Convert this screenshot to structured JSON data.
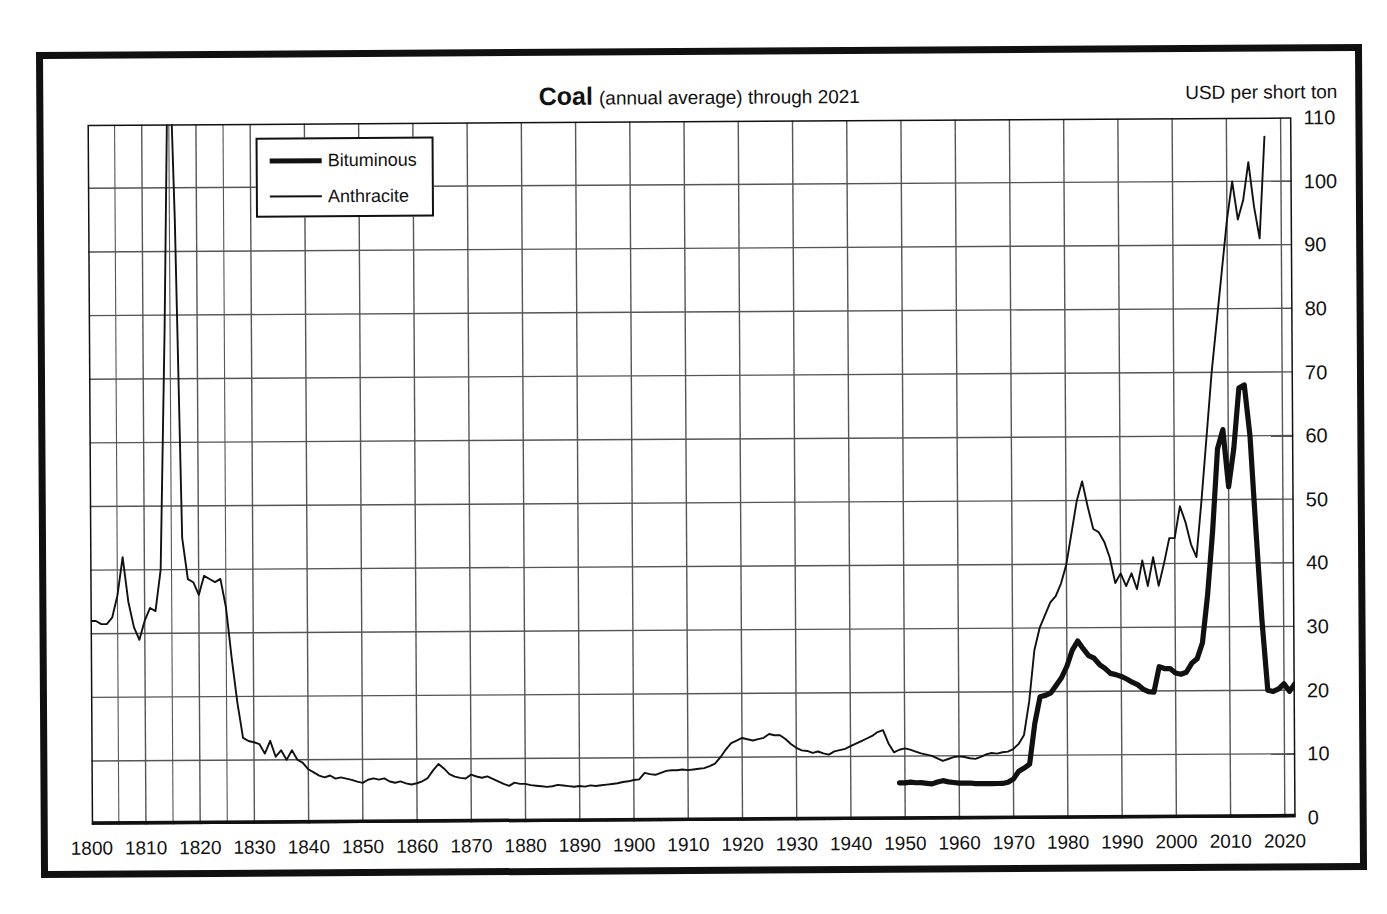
{
  "scan": {
    "top_artifact_text": ""
  },
  "header": {
    "title_main": "Coal",
    "title_sub": "(annual average) through 2021",
    "unit_label": "USD per short ton"
  },
  "legend": {
    "items": [
      {
        "label": "Bituminous",
        "style": "thick"
      },
      {
        "label": "Anthracite",
        "style": "thin"
      }
    ]
  },
  "colors": {
    "ink": "#111111",
    "grid": "#555555",
    "frame": "#101010",
    "background": "#ffffff"
  },
  "chart_data": {
    "type": "line",
    "title": "Coal (annual average) through 2021",
    "subtitle": "",
    "xlabel": "",
    "ylabel": "USD per short ton",
    "xlim": [
      1800,
      2022
    ],
    "ylim": [
      0,
      110
    ],
    "grid": true,
    "legend_position": "top-left-inside",
    "x_ticks": [
      1800,
      1810,
      1820,
      1830,
      1840,
      1850,
      1860,
      1870,
      1880,
      1890,
      1900,
      1910,
      1920,
      1930,
      1940,
      1950,
      1960,
      1970,
      1980,
      1990,
      2000,
      2010,
      2020
    ],
    "x_minor_tick_step": 5,
    "y_ticks": [
      0,
      10,
      20,
      30,
      40,
      50,
      60,
      70,
      80,
      90,
      100,
      110
    ],
    "y_tick_labels": [
      "0",
      "10",
      "20",
      "30",
      "40",
      "50",
      "60",
      "70",
      "80",
      "90",
      "100",
      "110"
    ],
    "series": [
      {
        "name": "Anthracite",
        "style": "thin",
        "x_start": 1800,
        "values": [
          32.0,
          32.0,
          31.5,
          31.5,
          32.5,
          36.0,
          42.0,
          35.0,
          31.0,
          29.0,
          32.0,
          34.0,
          33.5,
          40.0,
          78.0,
          128.0,
          95.0,
          45.0,
          38.5,
          38.0,
          36.0,
          39.0,
          38.5,
          38.0,
          38.5,
          34.0,
          26.0,
          19.0,
          13.5,
          13.0,
          12.8,
          12.5,
          11.0,
          13.0,
          10.5,
          11.5,
          10.0,
          11.5,
          10.0,
          9.5,
          8.5,
          8.0,
          7.5,
          7.2,
          7.5,
          7.0,
          7.2,
          7.0,
          6.8,
          6.5,
          6.3,
          6.8,
          7.0,
          6.8,
          7.0,
          6.5,
          6.3,
          6.5,
          6.2,
          6.0,
          6.2,
          6.5,
          7.0,
          8.2,
          9.2,
          8.5,
          7.6,
          7.2,
          7.0,
          6.9,
          7.5,
          7.2,
          7.0,
          7.2,
          6.8,
          6.4,
          6.0,
          5.7,
          6.2,
          6.0,
          6.0,
          5.8,
          5.7,
          5.6,
          5.5,
          5.6,
          5.8,
          5.7,
          5.6,
          5.5,
          5.6,
          5.5,
          5.7,
          5.6,
          5.7,
          5.8,
          5.9,
          6.0,
          6.2,
          6.3,
          6.5,
          6.6,
          7.6,
          7.4,
          7.3,
          7.6,
          7.9,
          8.0,
          8.0,
          8.1,
          8.0,
          8.1,
          8.2,
          8.3,
          8.6,
          9.0,
          10.0,
          11.2,
          12.2,
          12.6,
          13.0,
          12.8,
          12.6,
          12.8,
          13.0,
          13.6,
          13.4,
          13.4,
          12.8,
          12.0,
          11.4,
          11.0,
          10.9,
          10.6,
          10.8,
          10.5,
          10.3,
          10.8,
          11.0,
          11.2,
          11.6,
          12.0,
          12.4,
          12.8,
          13.2,
          13.8,
          14.1,
          12.0,
          10.6,
          11.0,
          11.2,
          11.0,
          10.7,
          10.4,
          10.2,
          10.0,
          9.6,
          9.2,
          9.5,
          9.8,
          9.9,
          9.8,
          9.6,
          9.5,
          9.8,
          10.2,
          10.4,
          10.3,
          10.5,
          10.6,
          11.0,
          11.8,
          13.2,
          18.5,
          26.5,
          30.0,
          32.0,
          34.0,
          35.0,
          37.0,
          40.0,
          45.0,
          50.0,
          53.0,
          49.0,
          45.5,
          45.0,
          43.5,
          41.0,
          37.0,
          38.5,
          36.5,
          38.5,
          36.0,
          40.5,
          36.5,
          41.0,
          36.5,
          40.0,
          44.0,
          44.0,
          49.0,
          46.5,
          43.0,
          41.0,
          50.0,
          60.0,
          70.0,
          78.0,
          86.0,
          94.0,
          100.0,
          94.0,
          97.0,
          103.0,
          96.0,
          91.0,
          107.0
        ]
      },
      {
        "name": "Bituminous",
        "style": "thick",
        "x_start": 1949,
        "values": [
          5.8,
          5.8,
          5.9,
          5.8,
          5.8,
          5.7,
          5.6,
          5.9,
          6.1,
          5.9,
          5.8,
          5.7,
          5.7,
          5.7,
          5.6,
          5.6,
          5.6,
          5.6,
          5.6,
          5.6,
          5.8,
          6.3,
          7.5,
          8.0,
          8.6,
          15.0,
          19.2,
          19.4,
          19.8,
          21.0,
          22.2,
          24.0,
          26.5,
          27.9,
          26.7,
          25.6,
          25.2,
          24.2,
          23.6,
          22.8,
          22.6,
          22.3,
          21.9,
          21.4,
          21.0,
          20.3,
          19.9,
          19.8,
          23.8,
          23.5,
          23.5,
          22.8,
          22.6,
          22.9,
          24.3,
          25.0,
          27.5,
          35.0,
          45.0,
          58.0,
          61.0,
          52.0,
          58.0,
          67.5,
          68.0,
          60.0,
          45.0,
          31.0,
          20.0,
          19.8,
          20.2,
          21.0,
          19.8,
          21.0
        ]
      }
    ]
  }
}
